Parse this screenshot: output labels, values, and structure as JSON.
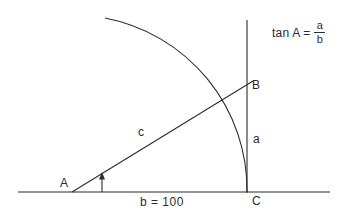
{
  "figure": {
    "type": "geometry-diagram",
    "background_color": "#ffffff",
    "stroke_color": "#2b2b2b"
  },
  "labels": {
    "vertex_a": "A",
    "vertex_b": "B",
    "vertex_c": "C",
    "side_a": "a",
    "side_c": "c",
    "base_measure": "b = 100"
  },
  "formula": {
    "lhs": "tan A",
    "equals": "=",
    "numerator": "a",
    "denominator": "b"
  },
  "geometry": {
    "point_a": [
      72,
      192
    ],
    "point_b": [
      247,
      85
    ],
    "point_c": [
      247,
      192
    ],
    "baseline": {
      "x1": 18,
      "y1": 192,
      "x2": 330,
      "y2": 192
    },
    "vertical_line": {
      "x1": 247,
      "y1": 20,
      "x2": 247,
      "y2": 193
    },
    "hypotenuse": {
      "x1": 72,
      "y1": 192,
      "x2": 252,
      "y2": 82
    },
    "arc": {
      "center": [
        72,
        192
      ],
      "radius": 175,
      "start": [
        247,
        192
      ],
      "end": [
        105,
        18
      ]
    },
    "angle_marker": {
      "x": 102,
      "y_base": 192,
      "y_tip": 173
    }
  }
}
